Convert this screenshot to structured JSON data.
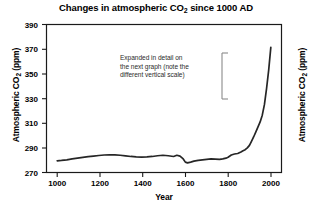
{
  "chart_data": {
    "type": "line",
    "title": "Changes in atmospheric CO2 since 1000 AD",
    "title_parts": {
      "before": "Changes in atmospheric CO",
      "sub": "2",
      "after": " since 1000 AD"
    },
    "xlabel": "Year",
    "ylabel": "Atmospheric CO2 (ppm)",
    "ylabel_parts": {
      "before": "Atmospheric CO",
      "sub": "2",
      "after": " (ppm)"
    },
    "ylabel_right": "Atmospheric CO2 (ppm)",
    "xlim": [
      950,
      2050
    ],
    "ylim": [
      270,
      390
    ],
    "xticks": [
      1000,
      1200,
      1400,
      1600,
      1800,
      2000
    ],
    "yticks": [
      270,
      290,
      310,
      330,
      350,
      370,
      390
    ],
    "xtick_labels": [
      "1000",
      "1200",
      "1400",
      "1600",
      "1800",
      "2000"
    ],
    "ytick_labels": [
      "270",
      "290",
      "310",
      "330",
      "350",
      "370",
      "390"
    ],
    "grid": false,
    "legend": null,
    "line_color": "#262626",
    "line_width": 1.7,
    "series": [
      {
        "name": "Atmospheric CO2",
        "x": [
          1000,
          1020,
          1045,
          1070,
          1095,
          1120,
          1145,
          1170,
          1195,
          1220,
          1245,
          1270,
          1295,
          1320,
          1345,
          1370,
          1395,
          1420,
          1445,
          1470,
          1495,
          1520,
          1545,
          1560,
          1575,
          1590,
          1600,
          1610,
          1625,
          1640,
          1660,
          1680,
          1700,
          1720,
          1740,
          1760,
          1775,
          1790,
          1800,
          1815,
          1830,
          1845,
          1860,
          1870,
          1880,
          1890,
          1900,
          1910,
          1920,
          1930,
          1940,
          1950,
          1960,
          1970,
          1980,
          1990,
          2000
        ],
        "y": [
          279.5,
          279.8,
          280.3,
          281.0,
          281.6,
          282.2,
          282.8,
          283.3,
          283.8,
          284.2,
          284.4,
          284.3,
          284.0,
          283.5,
          283.0,
          282.6,
          282.4,
          282.6,
          283.0,
          283.6,
          284.0,
          283.6,
          283.0,
          284.0,
          283.3,
          281.0,
          278.4,
          277.8,
          278.4,
          279.2,
          279.8,
          280.2,
          280.6,
          281.0,
          280.8,
          280.6,
          281.0,
          281.6,
          282.4,
          284.2,
          285.0,
          285.4,
          286.6,
          287.6,
          288.5,
          290.0,
          292.0,
          295.5,
          299.0,
          303.0,
          307.0,
          311.0,
          316.5,
          325.0,
          338.0,
          353.0,
          371.5
        ]
      }
    ],
    "annotations": [
      {
        "name": "expanded-detail-note",
        "lines": [
          "Expanded in detail on",
          "the next graph (note the",
          "different vertical scale)"
        ],
        "bracket": true,
        "bracket_color": "#8a8a8a"
      }
    ]
  }
}
